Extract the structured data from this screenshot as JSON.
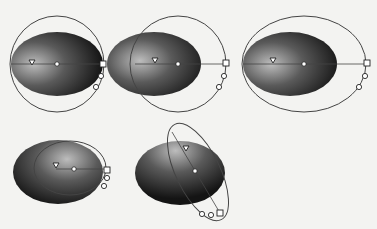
{
  "figure": {
    "background": "#f3f3f1",
    "fill_dark": "#141414",
    "fill_light": "#bdbdbd",
    "stroke_color": "#444444",
    "handle_fill": "#ffffff",
    "items": [
      {
        "id": "ellipse-1",
        "shape": {
          "cx": 57,
          "cy": 64,
          "rx": 46,
          "ry": 32
        },
        "highlight": {
          "fx": 0.25,
          "fy": 0.5
        },
        "control_ellipse": {
          "cx": 57,
          "cy": 64,
          "rx": 47,
          "ry": 48,
          "rotate": 0
        },
        "axis": {
          "x1": 11,
          "y1": 64,
          "x2": 103,
          "y2": 64
        },
        "center_dot": {
          "x": 57,
          "y": 64
        },
        "triangle": {
          "x": 32,
          "y": 62
        },
        "square": {
          "x": 103,
          "y": 64
        },
        "circles": [
          {
            "x": 101,
            "y": 76
          },
          {
            "x": 96,
            "y": 87
          }
        ]
      },
      {
        "id": "ellipse-2",
        "shape": {
          "cx": 154,
          "cy": 64,
          "rx": 47,
          "ry": 32
        },
        "highlight": {
          "fx": 0.35,
          "fy": 0.45
        },
        "control_ellipse": {
          "cx": 178,
          "cy": 64,
          "rx": 48,
          "ry": 48,
          "rotate": 0
        },
        "axis": {
          "x1": 135,
          "y1": 64,
          "x2": 226,
          "y2": 64
        },
        "center_dot": {
          "x": 178,
          "y": 64
        },
        "triangle": {
          "x": 155,
          "y": 60
        },
        "square": {
          "x": 226,
          "y": 63
        },
        "circles": [
          {
            "x": 224,
            "y": 76
          },
          {
            "x": 219,
            "y": 87
          }
        ]
      },
      {
        "id": "ellipse-3",
        "shape": {
          "cx": 290,
          "cy": 64,
          "rx": 47,
          "ry": 32
        },
        "highlight": {
          "fx": 0.3,
          "fy": 0.5
        },
        "control_ellipse": {
          "cx": 304,
          "cy": 64,
          "rx": 62,
          "ry": 48,
          "rotate": 0
        },
        "axis": {
          "x1": 243,
          "y1": 64,
          "x2": 366,
          "y2": 64
        },
        "center_dot": {
          "x": 304,
          "y": 64
        },
        "triangle": {
          "x": 273,
          "y": 60
        },
        "square": {
          "x": 367,
          "y": 63
        },
        "circles": [
          {
            "x": 365,
            "y": 76
          },
          {
            "x": 359,
            "y": 87
          }
        ]
      },
      {
        "id": "ellipse-4",
        "shape": {
          "cx": 58,
          "cy": 172,
          "rx": 45,
          "ry": 32
        },
        "highlight": {
          "fx": 0.6,
          "fy": 0.3
        },
        "control_ellipse": {
          "cx": 70,
          "cy": 168,
          "rx": 36,
          "ry": 27,
          "rotate": 0
        },
        "axis": {
          "x1": 56,
          "y1": 169,
          "x2": 107,
          "y2": 169
        },
        "center_dot": {
          "x": 74,
          "y": 169
        },
        "triangle": {
          "x": 56,
          "y": 165
        },
        "square": {
          "x": 107,
          "y": 170
        },
        "circles": [
          {
            "x": 107,
            "y": 178
          },
          {
            "x": 104,
            "y": 186
          }
        ]
      },
      {
        "id": "ellipse-5",
        "shape": {
          "cx": 180,
          "cy": 173,
          "rx": 45,
          "ry": 32
        },
        "highlight": {
          "fx": 0.45,
          "fy": 0.15
        },
        "control_ellipse": {
          "cx": 198,
          "cy": 172,
          "rx": 22,
          "ry": 53,
          "rotate": -26
        },
        "axis": {
          "x1": 172,
          "y1": 132,
          "x2": 220,
          "y2": 213
        },
        "center_dot": {
          "x": 195,
          "y": 171
        },
        "triangle": {
          "x": 186,
          "y": 148
        },
        "square": {
          "x": 220,
          "y": 213
        },
        "circles": [
          {
            "x": 211,
            "y": 215
          },
          {
            "x": 202,
            "y": 214
          }
        ]
      }
    ]
  }
}
